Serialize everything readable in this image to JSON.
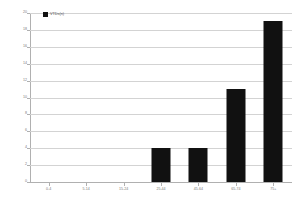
{
  "chart_data": {
    "type": "bar",
    "title": "",
    "subtitle": "",
    "xlabel": "",
    "ylabel": "",
    "grid": true,
    "legend_position": "top-left",
    "bar_color": "#111111",
    "gridline_color": "#d3d3d3",
    "axis_color": "#b0b0b0",
    "tick_label_color": "#7a7a7a",
    "categories": [
      "0-4",
      "5-14",
      "15-24",
      "25-44",
      "45-64",
      "65-74",
      "75+"
    ],
    "values": [
      0,
      0,
      0,
      4,
      4,
      11,
      19
    ],
    "ylim": [
      0,
      20
    ],
    "ytick_step": 2,
    "yticks": [
      "0",
      "2",
      "4",
      "6",
      "8",
      "10",
      "12",
      "14",
      "16",
      "18",
      "20"
    ],
    "series": [
      {
        "name": "VTDs(n)",
        "values": [
          0,
          0,
          0,
          4,
          4,
          11,
          19
        ]
      }
    ],
    "legend": [
      "VTDs(n)"
    ]
  }
}
